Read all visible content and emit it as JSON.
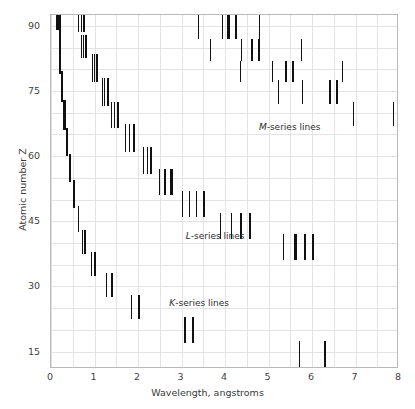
{
  "chart_data": {
    "type": "scatter",
    "title": "",
    "xlabel": "Wavelength, angstroms",
    "ylabel": "Atomic number Z",
    "xlim": [
      0,
      8
    ],
    "ylim": [
      11,
      92.5
    ],
    "xticks": [
      "0",
      "1",
      "2",
      "3",
      "4",
      "5",
      "6",
      "7",
      "8"
    ],
    "xtick_values": [
      0,
      1,
      2,
      3,
      4,
      5,
      6,
      7,
      8
    ],
    "yticks": [
      "15",
      "30",
      "45",
      "60",
      "75",
      "90"
    ],
    "ytick_values": [
      15,
      30,
      45,
      60,
      75,
      90
    ],
    "grid": true,
    "grid_x_step": 0.5,
    "grid_y_step": 5,
    "legend": "none",
    "annotations": [
      {
        "name": "m-series-label",
        "italic_prefix": "M",
        "text": "-series lines",
        "x": 4.78,
        "y": 66.5
      },
      {
        "name": "l-series-label",
        "italic_prefix": "L",
        "text": "-series lines",
        "x": 3.1,
        "y": 41.5
      },
      {
        "name": "k-series-label",
        "italic_prefix": "K",
        "text": "-series lines",
        "x": 2.72,
        "y": 26.0
      }
    ],
    "marker_style": "vertical line segment",
    "series": [
      {
        "name": "K-series lines",
        "color": "#111111",
        "points": [
          {
            "wavelength": 0.15,
            "z_low": 89.0,
            "z_high": 92.5,
            "weight": "thick"
          },
          {
            "wavelength": 0.21,
            "z_low": 85.5,
            "z_high": 92.5,
            "weight": "thick"
          },
          {
            "wavelength": 0.215,
            "z_low": 79.0,
            "z_high": 86.5,
            "weight": "thick"
          },
          {
            "wavelength": 0.26,
            "z_low": 72.5,
            "z_high": 79.5,
            "weight": "thick"
          },
          {
            "wavelength": 0.31,
            "z_low": 66.0,
            "z_high": 73.0,
            "weight": "thick"
          },
          {
            "wavelength": 0.36,
            "z_low": 60.0,
            "z_high": 66.5,
            "weight": "thick"
          },
          {
            "wavelength": 0.43,
            "z_low": 54.0,
            "z_high": 60.5,
            "weight": "thick"
          },
          {
            "wavelength": 0.52,
            "z_low": 48.0,
            "z_high": 54.5,
            "weight": "thick"
          },
          {
            "wavelength": 0.63,
            "z_low": 42.5,
            "z_high": 48.5,
            "weight": "thin"
          },
          {
            "wavelength": 0.72,
            "z_low": 37.5,
            "z_high": 43.0,
            "weight": "thin"
          },
          {
            "wavelength": 0.79,
            "z_low": 37.5,
            "z_high": 43.0,
            "weight": "thick"
          },
          {
            "wavelength": 0.94,
            "z_low": 32.5,
            "z_high": 38.0,
            "weight": "thin"
          },
          {
            "wavelength": 1.02,
            "z_low": 32.5,
            "z_high": 38.0,
            "weight": "thick"
          },
          {
            "wavelength": 1.27,
            "z_low": 27.5,
            "z_high": 33.0,
            "weight": "thin"
          },
          {
            "wavelength": 1.4,
            "z_low": 27.5,
            "z_high": 33.0,
            "weight": "thick"
          },
          {
            "wavelength": 1.85,
            "z_low": 22.5,
            "z_high": 28.0,
            "weight": "thin"
          },
          {
            "wavelength": 2.03,
            "z_low": 22.5,
            "z_high": 28.0,
            "weight": "thick"
          },
          {
            "wavelength": 3.08,
            "z_low": 17.0,
            "z_high": 23.0,
            "weight": "thin"
          },
          {
            "wavelength": 3.26,
            "z_low": 17.0,
            "z_high": 23.0,
            "weight": "thick"
          },
          {
            "wavelength": 5.72,
            "z_low": 11.5,
            "z_high": 17.5,
            "weight": "thin"
          },
          {
            "wavelength": 6.3,
            "z_low": 11.5,
            "z_high": 17.5,
            "weight": "thick"
          }
        ]
      },
      {
        "name": "L-series lines",
        "color": "#111111",
        "points": [
          {
            "wavelength": 0.64,
            "z_low": 88.5,
            "z_high": 92.5,
            "weight": "thin"
          },
          {
            "wavelength": 0.71,
            "z_low": 88.5,
            "z_high": 92.5,
            "weight": "thin"
          },
          {
            "wavelength": 0.755,
            "z_low": 88.5,
            "z_high": 92.5,
            "weight": "thick"
          },
          {
            "wavelength": 0.7,
            "z_low": 82.5,
            "z_high": 88.0,
            "weight": "thin"
          },
          {
            "wavelength": 0.755,
            "z_low": 82.5,
            "z_high": 88.0,
            "weight": "thin"
          },
          {
            "wavelength": 0.81,
            "z_low": 82.5,
            "z_high": 88.0,
            "weight": "thick"
          },
          {
            "wavelength": 0.955,
            "z_low": 77.0,
            "z_high": 83.5,
            "weight": "thin"
          },
          {
            "wavelength": 1.0,
            "z_low": 77.0,
            "z_high": 83.5,
            "weight": "thin"
          },
          {
            "wavelength": 1.06,
            "z_low": 77.0,
            "z_high": 83.5,
            "weight": "thick"
          },
          {
            "wavelength": 1.18,
            "z_low": 71.5,
            "z_high": 78.0,
            "weight": "thin"
          },
          {
            "wavelength": 1.24,
            "z_low": 71.5,
            "z_high": 78.0,
            "weight": "thin"
          },
          {
            "wavelength": 1.31,
            "z_low": 71.5,
            "z_high": 78.0,
            "weight": "thick"
          },
          {
            "wavelength": 1.4,
            "z_low": 66.5,
            "z_high": 72.5,
            "weight": "thin"
          },
          {
            "wavelength": 1.46,
            "z_low": 66.5,
            "z_high": 72.5,
            "weight": "thin"
          },
          {
            "wavelength": 1.54,
            "z_low": 66.5,
            "z_high": 72.5,
            "weight": "thick"
          },
          {
            "wavelength": 1.72,
            "z_low": 61.0,
            "z_high": 67.5,
            "weight": "thin"
          },
          {
            "wavelength": 1.8,
            "z_low": 61.0,
            "z_high": 67.5,
            "weight": "thin"
          },
          {
            "wavelength": 1.91,
            "z_low": 61.0,
            "z_high": 67.5,
            "weight": "thick"
          },
          {
            "wavelength": 2.12,
            "z_low": 56.0,
            "z_high": 62.0,
            "weight": "thin"
          },
          {
            "wavelength": 2.22,
            "z_low": 56.0,
            "z_high": 62.0,
            "weight": "thin"
          },
          {
            "wavelength": 2.3,
            "z_low": 56.0,
            "z_high": 62.0,
            "weight": "thick"
          },
          {
            "wavelength": 2.5,
            "z_low": 51.0,
            "z_high": 57.0,
            "weight": "thin"
          },
          {
            "wavelength": 2.62,
            "z_low": 51.0,
            "z_high": 57.0,
            "weight": "thin"
          },
          {
            "wavelength": 2.77,
            "z_low": 51.0,
            "z_high": 57.0,
            "weight": "thick"
          },
          {
            "wavelength": 3.02,
            "z_low": 46.0,
            "z_high": 52.0,
            "weight": "thin"
          },
          {
            "wavelength": 3.19,
            "z_low": 46.0,
            "z_high": 52.0,
            "weight": "thin"
          },
          {
            "wavelength": 3.35,
            "z_low": 46.0,
            "z_high": 52.0,
            "weight": "thin"
          },
          {
            "wavelength": 3.52,
            "z_low": 46.0,
            "z_high": 52.0,
            "weight": "thick"
          },
          {
            "wavelength": 3.9,
            "z_low": 41.0,
            "z_high": 47.0,
            "weight": "thin"
          },
          {
            "wavelength": 4.15,
            "z_low": 41.0,
            "z_high": 47.0,
            "weight": "thin"
          },
          {
            "wavelength": 4.37,
            "z_low": 41.0,
            "z_high": 47.0,
            "weight": "thick"
          },
          {
            "wavelength": 4.58,
            "z_low": 41.0,
            "z_high": 47.0,
            "weight": "thick"
          },
          {
            "wavelength": 5.35,
            "z_low": 36.0,
            "z_high": 42.0,
            "weight": "thin"
          },
          {
            "wavelength": 5.62,
            "z_low": 36.0,
            "z_high": 42.0,
            "weight": "thick"
          },
          {
            "wavelength": 5.83,
            "z_low": 36.0,
            "z_high": 42.0,
            "weight": "thick"
          },
          {
            "wavelength": 6.02,
            "z_low": 36.0,
            "z_high": 42.0,
            "weight": "thick"
          }
        ]
      },
      {
        "name": "M-series lines",
        "color": "#111111",
        "points": [
          {
            "wavelength": 3.4,
            "z_low": 87.0,
            "z_high": 92.5,
            "weight": "thin"
          },
          {
            "wavelength": 3.95,
            "z_low": 87.0,
            "z_high": 92.5,
            "weight": "thin"
          },
          {
            "wavelength": 4.08,
            "z_low": 87.0,
            "z_high": 92.5,
            "weight": "thick"
          },
          {
            "wavelength": 4.25,
            "z_low": 87.0,
            "z_high": 92.5,
            "weight": "thick"
          },
          {
            "wavelength": 4.8,
            "z_low": 87.0,
            "z_high": 92.5,
            "weight": "thin"
          },
          {
            "wavelength": 3.66,
            "z_low": 82.0,
            "z_high": 87.0,
            "weight": "thin"
          },
          {
            "wavelength": 4.37,
            "z_low": 82.0,
            "z_high": 87.0,
            "weight": "thin"
          },
          {
            "wavelength": 4.62,
            "z_low": 82.0,
            "z_high": 87.0,
            "weight": "thick"
          },
          {
            "wavelength": 4.78,
            "z_low": 82.0,
            "z_high": 87.0,
            "weight": "thick"
          },
          {
            "wavelength": 5.75,
            "z_low": 82.0,
            "z_high": 87.0,
            "weight": "thin"
          },
          {
            "wavelength": 4.35,
            "z_low": 77.0,
            "z_high": 82.0,
            "weight": "thin"
          },
          {
            "wavelength": 5.1,
            "z_low": 77.0,
            "z_high": 82.0,
            "weight": "thin"
          },
          {
            "wavelength": 5.4,
            "z_low": 77.0,
            "z_high": 82.0,
            "weight": "thick"
          },
          {
            "wavelength": 5.56,
            "z_low": 77.0,
            "z_high": 82.0,
            "weight": "thick"
          },
          {
            "wavelength": 6.7,
            "z_low": 77.0,
            "z_high": 82.0,
            "weight": "thin"
          },
          {
            "wavelength": 5.22,
            "z_low": 72.0,
            "z_high": 77.5,
            "weight": "thin"
          },
          {
            "wavelength": 5.78,
            "z_low": 72.0,
            "z_high": 77.5,
            "weight": "thin"
          },
          {
            "wavelength": 6.42,
            "z_low": 72.0,
            "z_high": 77.5,
            "weight": "thick"
          },
          {
            "wavelength": 6.58,
            "z_low": 72.0,
            "z_high": 77.5,
            "weight": "thick"
          },
          {
            "wavelength": 6.95,
            "z_low": 67.0,
            "z_high": 72.5,
            "weight": "thin"
          },
          {
            "wavelength": 7.88,
            "z_low": 67.0,
            "z_high": 72.5,
            "weight": "thin"
          }
        ]
      }
    ]
  },
  "style": {
    "line_color": "#111111",
    "grid_color": "#e3e3e3",
    "frame_color": "#b9b9b9",
    "background": "#ffffff",
    "text_color": "#3a3a3a"
  }
}
